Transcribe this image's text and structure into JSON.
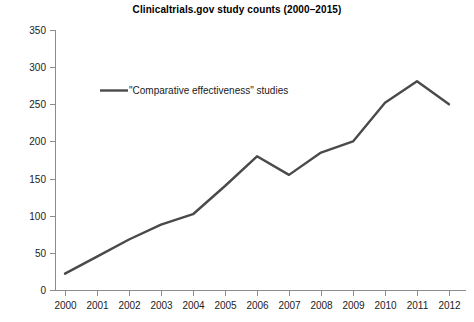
{
  "chart_data": {
    "type": "line",
    "title": "Clinicaltrials.gov study counts (2000–2015)",
    "xlabel": "",
    "ylabel": "",
    "grid": false,
    "legend_position": "inside-top-left",
    "x": [
      2000,
      2001,
      2002,
      2003,
      2004,
      2005,
      2006,
      2007,
      2008,
      2009,
      2010,
      2011,
      2012
    ],
    "categories": [
      "2000",
      "2001",
      "2002",
      "2003",
      "2004",
      "2005",
      "2006",
      "2007",
      "2008",
      "2009",
      "2010",
      "2011",
      "2012"
    ],
    "xlim": [
      2000,
      2012.5
    ],
    "ylim": [
      0,
      350
    ],
    "yticks": [
      0,
      50,
      100,
      150,
      200,
      250,
      300,
      350
    ],
    "ytick_labels": [
      "0",
      "50",
      "100",
      "150",
      "200",
      "250",
      "300",
      "350"
    ],
    "xticks": [
      2000,
      2001,
      2002,
      2003,
      2004,
      2005,
      2006,
      2007,
      2008,
      2009,
      2010,
      2011,
      2012
    ],
    "xtick_labels": [
      "2000",
      "2001",
      "2002",
      "2003",
      "2004",
      "2005",
      "2006",
      "2007",
      "2008",
      "2009",
      "2010",
      "2011",
      "2012"
    ],
    "series": [
      {
        "name": "\"Comparative effectiveness\" studies",
        "color": "#4a4a4a",
        "values": [
          22,
          45,
          68,
          88,
          102,
          140,
          180,
          155,
          185,
          200,
          252,
          281,
          250
        ]
      }
    ],
    "line_color": "#4a4a4a",
    "axis_color": "#8c8c8c",
    "background_color": "#ffffff"
  },
  "legend": {
    "entries": [
      {
        "label": "\"Comparative effectiveness\" studies",
        "color": "#4a4a4a"
      }
    ]
  }
}
